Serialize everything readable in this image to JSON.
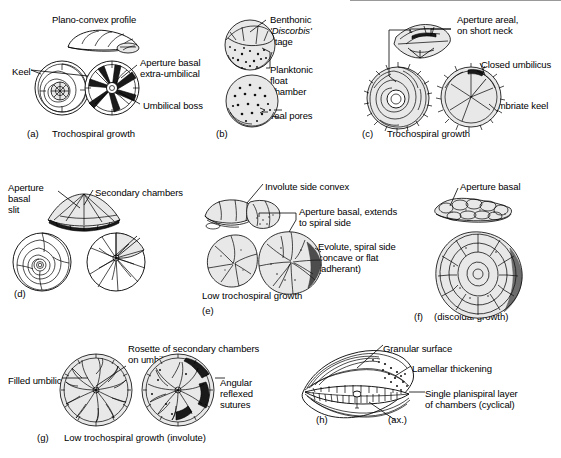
{
  "figure": {
    "background": "#ffffff",
    "ink": "#000000"
  },
  "panels": [
    {
      "id": "a",
      "tag": "(a)",
      "caption": "Trochospiral growth",
      "labels": [
        {
          "name": "plano-convex-profile",
          "text": "Plano-convex profile"
        },
        {
          "name": "keel",
          "text": "Keel"
        },
        {
          "name": "aperture-basal-extra-umbilical",
          "text": "Aperture basal\nextra-umbilical"
        },
        {
          "name": "umbilical-boss",
          "text": "Umbilical boss"
        }
      ]
    },
    {
      "id": "b",
      "tag": "(b)",
      "caption": "",
      "labels": [
        {
          "name": "benthonic-discorbis-stage",
          "text": "Benthonic",
          "text_italic": "'Discorbis'",
          "text_tail": "stage"
        },
        {
          "name": "planktonic-float-chamber",
          "text": "Planktonic\nfloat\nchamber"
        },
        {
          "name": "areal-pores",
          "text": "Areal pores"
        }
      ]
    },
    {
      "id": "c",
      "tag": "(c)",
      "caption": "Trochospiral growth",
      "labels": [
        {
          "name": "aperture-areal-short-neck",
          "text": "Aperture areal,\non short neck"
        },
        {
          "name": "closed-umbilicus",
          "text": "Closed umbilicus"
        },
        {
          "name": "fimbriate-keel",
          "text": "Fimbriate keel"
        }
      ]
    },
    {
      "id": "d",
      "tag": "(d)",
      "caption": "",
      "labels": [
        {
          "name": "aperture-basal-slit",
          "text": "Aperture\nbasal\nslit"
        },
        {
          "name": "secondary-chambers",
          "text": "Secondary chambers"
        }
      ]
    },
    {
      "id": "e",
      "tag": "(e)",
      "caption": "Low trochospiral growth",
      "labels": [
        {
          "name": "involute-side-convex",
          "text": "Involute side convex"
        },
        {
          "name": "aperture-basal-extends-spiral",
          "text": "Aperture basal, extends\nto spiral side"
        },
        {
          "name": "evolute-spiral-side",
          "text": "Evolute, spiral side\nconcave or flat\n(adherant)"
        }
      ]
    },
    {
      "id": "f",
      "tag": "(f)",
      "caption": "Low trochospiral\nto planispiral\n(discoidal growth)",
      "labels": [
        {
          "name": "aperture-basal",
          "text": "Aperture basal"
        }
      ]
    },
    {
      "id": "g",
      "tag": "(g)",
      "caption": "Low trochospiral growth (involute)",
      "labels": [
        {
          "name": "filled-umbilicus",
          "text": "Filled umbilicus"
        },
        {
          "name": "rosette-secondary-chambers",
          "text": "Rosette of secondary chambers\non umbilical side"
        },
        {
          "name": "angular-reflexed-sutures",
          "text": "Angular\nreflexed\nsutures"
        }
      ]
    },
    {
      "id": "h",
      "tag": "(h)",
      "caption": "",
      "labels": [
        {
          "name": "granular-surface",
          "text": "Granular surface"
        },
        {
          "name": "lamellar-thickening",
          "text": "Lamellar thickening"
        },
        {
          "name": "single-planispiral-layer",
          "text": "Single planispiral layer\nof chambers (cyclical)"
        },
        {
          "name": "axis-marker",
          "text": "(ax.)"
        }
      ]
    }
  ],
  "text": {
    "a": {
      "tag": "(a)",
      "caption": "Trochospiral growth",
      "plano_convex": "Plano-convex profile",
      "keel": "Keel",
      "aperture_l1": "Aperture basal",
      "aperture_l2": "extra-umbilical",
      "umbilical_boss": "Umbilical boss"
    },
    "b": {
      "tag": "(b)",
      "benthonic": "Benthonic",
      "discorbis": "'Discorbis'",
      "stage": "stage",
      "planktonic_l1": "Planktonic",
      "planktonic_l2": "float",
      "planktonic_l3": "chamber",
      "areal_pores": "Areal pores"
    },
    "c": {
      "tag": "(c)",
      "caption": "Trochospiral growth",
      "aperture_l1": "Aperture areal,",
      "aperture_l2": "on short neck",
      "closed_umbilicus": "Closed umbilicus",
      "fimbriate_keel": "Fimbriate keel"
    },
    "d": {
      "tag": "(d)",
      "aperture_l1": "Aperture",
      "aperture_l2": "basal",
      "aperture_l3": "slit",
      "secondary_chambers": "Secondary chambers"
    },
    "e": {
      "tag": "(e)",
      "caption": "Low trochospiral growth",
      "involute": "Involute side convex",
      "aperture_l1": "Aperture basal, extends",
      "aperture_l2": "to spiral side",
      "evolute_l1": "Evolute, spiral side",
      "evolute_l2": "concave or flat",
      "evolute_l3": "(adherant)"
    },
    "f": {
      "tag": "(f)",
      "aperture_basal": "Aperture basal",
      "caption_l1": "Low trochospiral",
      "caption_l2": "to planispiral",
      "caption_l3": "(discoidal growth)"
    },
    "g": {
      "tag": "(g)",
      "caption": "Low trochospiral growth (involute)",
      "filled_umbilicus": "Filled umbilicus",
      "rosette_l1": "Rosette of secondary chambers",
      "rosette_l2": "on umbilical side",
      "angular_l1": "Angular",
      "angular_l2": "reflexed",
      "angular_l3": "sutures"
    },
    "h": {
      "tag": "(h)",
      "granular_surface": "Granular surface",
      "lamellar_thickening": "Lamellar thickening",
      "single_l1": "Single planispiral layer",
      "single_l2": "of chambers (cyclical)",
      "ax": "(ax.)"
    }
  }
}
